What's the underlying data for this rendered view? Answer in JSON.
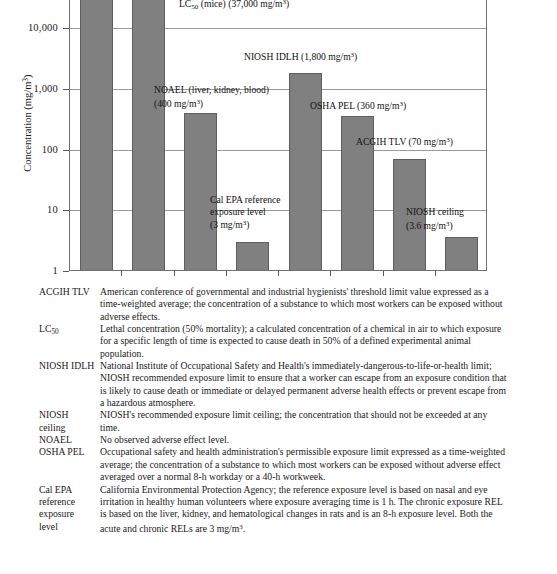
{
  "chart_data": {
    "type": "bar",
    "title": "",
    "xlabel": "",
    "ylabel": "Concentration (mg/m3)",
    "ylabel_parts": {
      "prefix": "Concentration (mg/m",
      "sup": "3",
      "suffix": ")"
    },
    "scale": "log",
    "ylim": [
      1,
      100000
    ],
    "grid": true,
    "legend": "none",
    "ytick_labels": [
      "10,000",
      "1,000",
      "100",
      "10",
      "1"
    ],
    "ytick_values": [
      10000,
      1000,
      100,
      10,
      1
    ],
    "categories": [
      "Bar 1 (off-scale)",
      "LC50 (mice)",
      "NOAEL (liver, kidney, blood)",
      "Cal EPA reference exposure level",
      "NIOSH IDLH",
      "OSHA PEL",
      "ACGIH TLV",
      "NIOSH ceiling"
    ],
    "values": [
      90000,
      37000,
      400,
      3,
      1800,
      360,
      70,
      3.6
    ],
    "units": "mg/m3",
    "annotations": [
      {
        "index": 1,
        "lines": [
          {
            "text_before": "LC",
            "sub": "50",
            "text_after": " (mice) (37,000 mg/m",
            "sup": "3",
            "tail": ")"
          }
        ]
      },
      {
        "index": 2,
        "lines": [
          {
            "text_before": "NOAEL (liver, kidney, blood)",
            "sub": "",
            "text_after": "",
            "sup": "",
            "tail": ""
          },
          {
            "text_before": "(400 mg/m",
            "sub": "",
            "text_after": "",
            "sup": "3",
            "tail": ")"
          }
        ]
      },
      {
        "index": 3,
        "lines": [
          {
            "text_before": "Cal EPA reference",
            "sup": "",
            "tail": ""
          },
          {
            "text_before": "exposure level",
            "sup": "",
            "tail": ""
          },
          {
            "text_before": "(3 mg/m",
            "sup": "3",
            "tail": ")"
          }
        ]
      },
      {
        "index": 4,
        "lines": [
          {
            "text_before": "NIOSH IDLH (1,800 mg/m",
            "sup": "3",
            "tail": ")"
          }
        ]
      },
      {
        "index": 5,
        "lines": [
          {
            "text_before": "OSHA PEL (360 mg/m",
            "sup": "3",
            "tail": ")"
          }
        ]
      },
      {
        "index": 6,
        "lines": [
          {
            "text_before": "ACGIH TLV (70 mg/m",
            "sup": "3",
            "tail": ")"
          }
        ]
      },
      {
        "index": 7,
        "lines": [
          {
            "text_before": "NIOSH ceiling",
            "sup": "",
            "tail": ""
          },
          {
            "text_before": "(3.6 mg/m",
            "sup": "3",
            "tail": ")"
          }
        ]
      }
    ]
  },
  "glossary": [
    {
      "term": "ACGIH TLV",
      "term_lines": [
        "ACGIH TLV"
      ],
      "definition": "American conference of governmental and industrial hygienists' threshold limit value expressed as a time-weighted average; the concentration of a substance to which most workers can be exposed without adverse effects."
    },
    {
      "term": "LC50",
      "term_lines": [
        "LC50"
      ],
      "term_base": "LC",
      "term_sub": "50",
      "definition": "Lethal concentration (50% mortality); a calculated concentration of a chemical in air to which exposure for a specific length of time is expected to cause death in 50% of a defined experimental animal population."
    },
    {
      "term": "NIOSH IDLH",
      "term_lines": [
        "NIOSH IDLH"
      ],
      "definition": "National Institute of Occupational Safety and Health's immediately-dangerous-to-life-or-health limit; NIOSH recommended exposure limit to ensure that a worker can escape from an exposure condition that is likely to cause death or immediate or delayed permanent adverse health effects or prevent escape from a hazardous atmosphere."
    },
    {
      "term": "NIOSH ceiling",
      "term_lines": [
        "NIOSH",
        "ceiling"
      ],
      "definition": "NIOSH's recommended exposure limit ceiling; the concentration that should not be exceeded at any time."
    },
    {
      "term": "NOAEL",
      "term_lines": [
        "NOAEL"
      ],
      "definition": "No observed adverse effect level."
    },
    {
      "term": "OSHA PEL",
      "term_lines": [
        "OSHA PEL"
      ],
      "definition": "Occupational safety and health administration's permissible exposure limit expressed as a time-weighted average; the concentration of a substance to which most workers can be exposed without adverse effect averaged over a normal 8-h workday or a 40-h workweek."
    },
    {
      "term": "Cal EPA reference exposure level",
      "term_lines": [
        "Cal EPA",
        "reference",
        "exposure",
        "level"
      ],
      "definition": "California Environmental Protection Agency; the reference exposure level is based on nasal and eye irritation in healthy human volunteers where exposure averaging time is 1 h. The chronic exposure REL is based on the liver, kidney, and hematological changes in rats and is an 8-h exposure level. Both the acute and chronic RELs are 3 mg/m3."
    }
  ],
  "caption": "FIGURE 1.1"
}
